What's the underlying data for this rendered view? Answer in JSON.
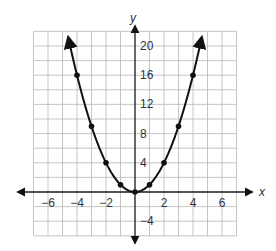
{
  "chart_data": {
    "type": "line",
    "title": "",
    "xlabel": "x",
    "ylabel": "y",
    "function": "y = x^2",
    "xlim": [
      -7,
      7
    ],
    "ylim": [
      -6,
      22
    ],
    "grid": true,
    "x_grid_step": 1,
    "y_grid_step": 2,
    "x_ticks": [
      -6,
      -4,
      -2,
      2,
      4,
      6
    ],
    "x_tick_labels": [
      "−6",
      "−4",
      "−2",
      "2",
      "4",
      "6"
    ],
    "y_ticks": [
      -4,
      4,
      8,
      12,
      16,
      20
    ],
    "y_tick_labels": [
      "−4",
      "4",
      "8",
      "12",
      "16",
      "20"
    ],
    "series": [
      {
        "name": "parabola",
        "x": [
          -4,
          -3,
          -2,
          -1,
          0,
          1,
          2,
          3,
          4
        ],
        "y": [
          16,
          9,
          4,
          1,
          0,
          1,
          4,
          9,
          16
        ],
        "markers": true,
        "arrows_at_ends": true
      }
    ],
    "legend": null
  },
  "colors": {
    "curve": "#111111",
    "axis": "#1a1a1a",
    "grid": "#b8b8b8",
    "text": "#333333"
  }
}
